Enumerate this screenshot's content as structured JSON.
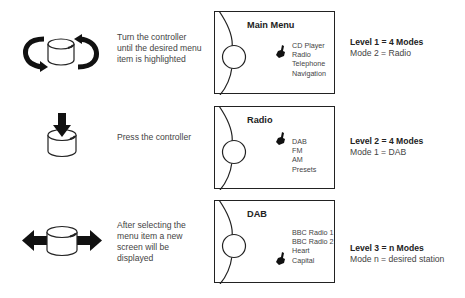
{
  "steps": [
    {
      "description": "Turn the controller until the desired menu item is highlighted",
      "description_lines": [
        "Turn the controller",
        "until the desired menu",
        "item is highlighted"
      ],
      "icon": "rotate-controller-icon",
      "screen": {
        "title": "Main Menu",
        "items": [
          "CD Player",
          "Radio",
          "Telephone",
          "Navigation"
        ],
        "pointer_at": 1
      },
      "level": {
        "heading": "Level 1 = 4 Modes",
        "detail": "Mode 2 = Radio"
      }
    },
    {
      "description": "Press the controller",
      "description_lines": [
        "Press the controller"
      ],
      "icon": "press-controller-icon",
      "screen": {
        "title": "Radio",
        "items": [
          "DAB",
          "FM",
          "AM",
          "Presets"
        ],
        "pointer_at": 0
      },
      "level": {
        "heading": "Level 2 = 4 Modes",
        "detail": "Mode 1 = DAB"
      }
    },
    {
      "description": "After selecting the menu item a new screen will be displayed",
      "description_lines": [
        "After selecting the",
        "menu item a new",
        "screen will be",
        "displayed"
      ],
      "icon": "slide-controller-icon",
      "screen": {
        "title": "DAB",
        "items": [
          "BBC Radio 1",
          "BBC Radio 2",
          "Heart",
          "Capital"
        ],
        "pointer_at": 3
      },
      "level": {
        "heading": "Level 3 = n Modes",
        "detail": "Mode n = desired station"
      }
    }
  ]
}
